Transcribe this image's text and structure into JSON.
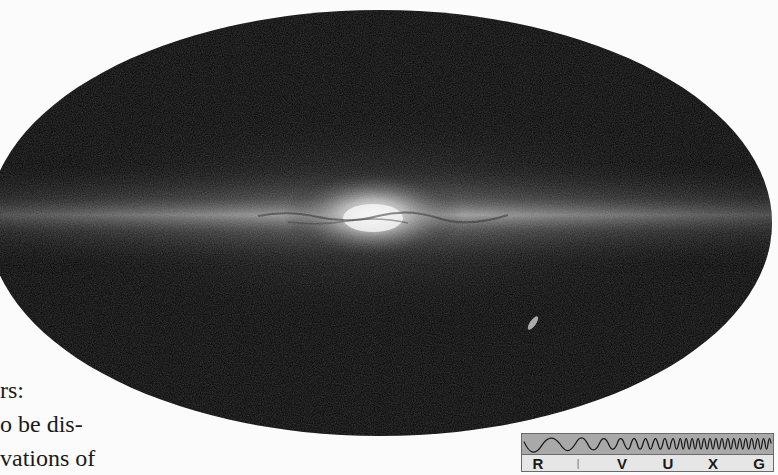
{
  "figure": {
    "colors": {
      "sky_background": "#020202",
      "page_background": "#fbfbfb",
      "band_glow": "#d8d8d8"
    }
  },
  "body_text": {
    "lines": [
      "rs:",
      "o be dis-",
      "vations of"
    ]
  },
  "wavelength_badge": {
    "bands": [
      {
        "label": "R",
        "highlighted": false
      },
      {
        "label": "I",
        "highlighted": true
      },
      {
        "label": "V",
        "highlighted": false
      },
      {
        "label": "U",
        "highlighted": false
      },
      {
        "label": "X",
        "highlighted": false
      },
      {
        "label": "G",
        "highlighted": false
      }
    ],
    "active_band": "I"
  }
}
